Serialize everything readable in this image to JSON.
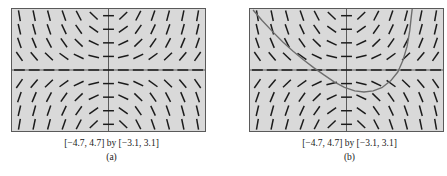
{
  "figure": {
    "panels": [
      {
        "id": "a",
        "label": "(a)",
        "range_caption": "[−4.7, 4.7] by [−3.1, 3.1]",
        "has_solution_curve": false
      },
      {
        "id": "b",
        "label": "(b)",
        "range_caption": "[−4.7, 4.7] by [−3.1, 3.1]",
        "has_solution_curve": true
      }
    ]
  },
  "chart_data": [
    {
      "type": "scatter",
      "title": "",
      "subtitle": "",
      "xlabel": "",
      "ylabel": "",
      "xlim": [
        -4.7,
        4.7
      ],
      "ylim": [
        -3.1,
        3.1
      ],
      "grid": true,
      "axes_lines": [
        "x-axis at y=0",
        "y-axis at x=0"
      ],
      "legend": "none",
      "annotations": [
        "[−4.7, 4.7] by [−3.1, 3.1]",
        "(a)"
      ],
      "description": "slope field of dy/dx = x*y/2 drawn as short tangent dashes on a 13x9 lattice",
      "slope_field": {
        "formula": "x*y/2",
        "x_samples": [
          -4.34,
          -3.62,
          -2.9,
          -2.17,
          -1.45,
          -0.72,
          0,
          0.72,
          1.45,
          2.17,
          2.9,
          3.62,
          4.34
        ],
        "y_samples": [
          2.76,
          2.07,
          1.38,
          0.69,
          0,
          -0.69,
          -1.38,
          -2.07,
          -2.76
        ],
        "dash_length_px": 11,
        "dash_color": "#1b1b1b"
      },
      "curve": null
    },
    {
      "type": "line",
      "title": "",
      "subtitle": "",
      "xlabel": "",
      "ylabel": "",
      "xlim": [
        -4.7,
        4.7
      ],
      "ylim": [
        -3.1,
        3.1
      ],
      "grid": true,
      "axes_lines": [
        "x-axis at y=0",
        "y-axis at x=0"
      ],
      "legend": "none",
      "annotations": [
        "[−4.7, 4.7] by [−3.1, 3.1]",
        "(b)"
      ],
      "description": "same slope field with one particular solution curve superimposed, entering top-left, reaching a minimum right of the y-axis, then rising steeply",
      "slope_field": {
        "formula": "x*y/2",
        "x_samples": [
          -4.34,
          -3.62,
          -2.9,
          -2.17,
          -1.45,
          -0.72,
          0,
          0.72,
          1.45,
          2.17,
          2.9,
          3.62,
          4.34
        ],
        "y_samples": [
          2.76,
          2.07,
          1.38,
          0.69,
          0,
          -0.69,
          -1.38,
          -2.07,
          -2.76
        ],
        "dash_length_px": 11,
        "dash_color": "#1b1b1b"
      },
      "curve": {
        "color": "#6e6e6e",
        "width_px": 1.4,
        "points_xy": [
          [
            -4.55,
            3.05
          ],
          [
            -4.1,
            2.5
          ],
          [
            -3.6,
            1.95
          ],
          [
            -3.1,
            1.42
          ],
          [
            -2.6,
            0.95
          ],
          [
            -2.1,
            0.52
          ],
          [
            -1.6,
            0.12
          ],
          [
            -1.1,
            -0.25
          ],
          [
            -0.6,
            -0.6
          ],
          [
            -0.1,
            -0.88
          ],
          [
            0.4,
            -1.06
          ],
          [
            0.85,
            -1.12
          ],
          [
            1.3,
            -1.06
          ],
          [
            1.75,
            -0.88
          ],
          [
            2.15,
            -0.55
          ],
          [
            2.5,
            -0.1
          ],
          [
            2.75,
            0.5
          ],
          [
            2.95,
            1.2
          ],
          [
            3.08,
            2.0
          ],
          [
            3.16,
            2.75
          ],
          [
            3.2,
            3.1
          ]
        ]
      }
    }
  ],
  "colors": {
    "plot_background": "#d9d9d9",
    "frame": "#5a5a5a",
    "axis": "#4a4a4a",
    "dash": "#1b1b1b",
    "curve": "#6e6e6e",
    "page_background": "#ffffff",
    "text": "#1a1a1a"
  }
}
